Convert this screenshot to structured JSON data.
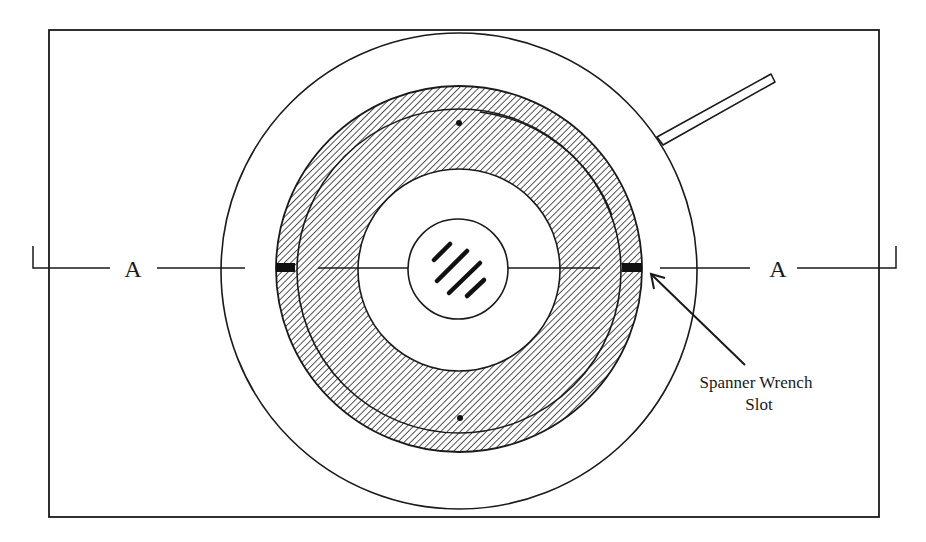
{
  "diagram": {
    "section_label_left": "A",
    "section_label_right": "A",
    "callout_line1": "Spanner Wrench",
    "callout_line2": "Slot",
    "colors": {
      "stroke": "#1a1a1a",
      "background": "#ffffff",
      "hatch": "#2a2a2a"
    },
    "parts": [
      {
        "name": "frame",
        "description": "Rectangular outline"
      },
      {
        "name": "outer-housing-circle"
      },
      {
        "name": "hatched-retaining-ring"
      },
      {
        "name": "inner-ring-line"
      },
      {
        "name": "clear-center-bore"
      },
      {
        "name": "lens-window",
        "description": "Small circle with diagonal glare marks"
      },
      {
        "name": "spanner-wrench-slots",
        "count": 2
      },
      {
        "name": "alignment-dots",
        "count": 2
      },
      {
        "name": "handle-arm"
      },
      {
        "name": "section-line-A-A"
      }
    ]
  }
}
